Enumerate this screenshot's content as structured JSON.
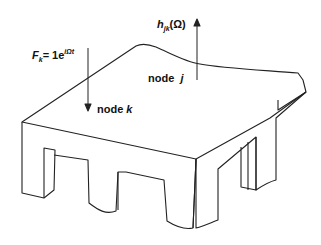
{
  "diagram": {
    "type": "isometric structure with force and response arrows",
    "labels": {
      "force_symbol": "F",
      "force_subscript": "k",
      "force_eq": "= 1e",
      "force_exponent": "iΩt",
      "response_symbol": "h",
      "response_subscript": "jk",
      "response_arg": "(Ω)",
      "node_j_word": "node",
      "node_j_id": "j",
      "node_k_word": "node",
      "node_k_id": "k"
    },
    "elements": [
      {
        "name": "plate-top-surface"
      },
      {
        "name": "force-arrow",
        "direction": "down",
        "at": "node k"
      },
      {
        "name": "response-arrow",
        "direction": "up",
        "at": "node j"
      },
      {
        "name": "front-legs",
        "count": 3
      },
      {
        "name": "side-legs",
        "count": 2
      }
    ],
    "colors": {
      "stroke": "#222222",
      "background": "#ffffff"
    }
  }
}
